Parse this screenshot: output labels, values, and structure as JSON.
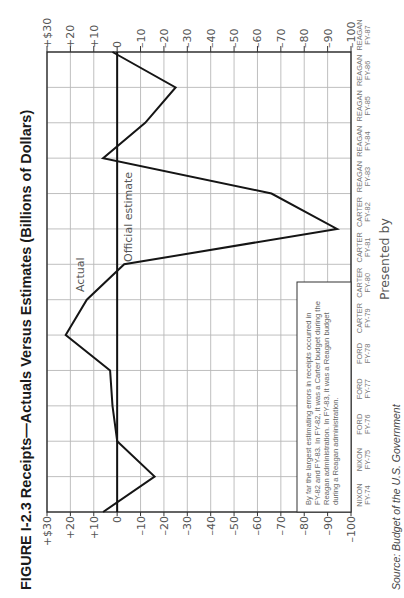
{
  "figure": {
    "title": "FIGURE I-2.3  Receipts—Actuals Versus Estimates (Billions of Dollars)",
    "series_labels": {
      "actual": "Actual",
      "estimate": "Official estimate"
    },
    "annotation": [
      "By far the largest estimating errors in receipts occurred in",
      "FY-82 and FY-83. In FY-82, it was a Carter budget during the",
      "Reagan administration. In FY-83, it was a Reagan budget",
      "during a Reagan administration."
    ],
    "presented_by": "Presented by",
    "source": "Source: Budget of the U.S. Government"
  },
  "chart_data": {
    "type": "line",
    "title": "Receipts—Actuals Versus Estimates (Billions of Dollars)",
    "orientation": "rotated 90° counter-clockwise",
    "xlabel": "Fiscal year (administration)",
    "ylabel": "Billions of Dollars (Actual minus Official estimate)",
    "ylim": [
      -100,
      30
    ],
    "y_ticks": [
      "+$30",
      "+20",
      "+10",
      "0",
      "–10",
      "–20",
      "–30",
      "–40",
      "–50",
      "–60",
      "–70",
      "–80",
      "–90",
      "–100"
    ],
    "categories": [
      {
        "admin": "NIXON",
        "fy": "FY-74"
      },
      {
        "admin": "NIXON",
        "fy": "FY-75"
      },
      {
        "admin": "FORD",
        "fy": "FY-76"
      },
      {
        "admin": "FORD",
        "fy": "FY-77"
      },
      {
        "admin": "FORD",
        "fy": "FY-78"
      },
      {
        "admin": "CARTER",
        "fy": "FY-79"
      },
      {
        "admin": "CARTER",
        "fy": "FY-80"
      },
      {
        "admin": "CARTER",
        "fy": "FY-81"
      },
      {
        "admin": "CARTER",
        "fy": "FY-82"
      },
      {
        "admin": "REAGAN",
        "fy": "FY-83"
      },
      {
        "admin": "REAGAN",
        "fy": "FY-84"
      },
      {
        "admin": "REAGAN",
        "fy": "FY-85"
      },
      {
        "admin": "REAGAN",
        "fy": "FY-86"
      },
      {
        "admin": "REAGAN",
        "fy": "FY-87"
      }
    ],
    "series": [
      {
        "name": "Actual",
        "values": [
          6,
          -16,
          0,
          2,
          3,
          22,
          13,
          -3,
          -94,
          -66,
          6,
          -12,
          -25,
          2
        ]
      },
      {
        "name": "Official estimate",
        "values": [
          0,
          0,
          0,
          0,
          0,
          0,
          0,
          0,
          0,
          0,
          0,
          0,
          0,
          0
        ]
      }
    ],
    "grid": true,
    "legend": "inline labels"
  }
}
